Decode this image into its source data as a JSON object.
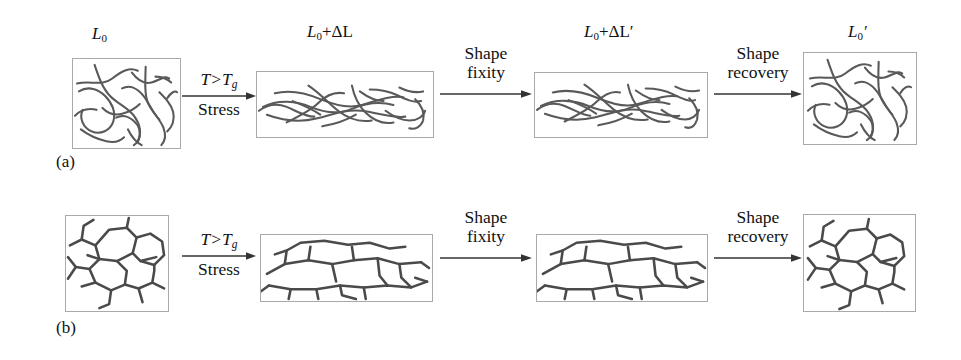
{
  "figure": {
    "background_color": "#ffffff",
    "line_color": "#4a4a4a",
    "box_border_color": "#a9a9a9",
    "width": 961,
    "height": 360
  },
  "panels": [
    {
      "id": "a",
      "label": "(a)",
      "states": [
        {
          "name": "initial",
          "length_label_parts": {
            "base": "L",
            "sub": "0",
            "suffix": ""
          }
        },
        {
          "name": "deformed",
          "length_label_parts": {
            "base": "L",
            "sub": "0",
            "suffix": "+ΔL"
          }
        },
        {
          "name": "fixed",
          "length_label_parts": {
            "base": "L",
            "sub": "0",
            "suffix": "+ΔL′"
          }
        },
        {
          "name": "recovered",
          "length_label_parts": {
            "base": "L",
            "sub": "0",
            "suffix": "′"
          }
        }
      ],
      "transitions": [
        {
          "name": "heat-and-stress",
          "line1": "T>T",
          "line1_sub": "g",
          "line2": "Stress",
          "italic": true,
          "text_position": "split"
        },
        {
          "name": "shape-fixity",
          "line1": "Shape",
          "line2": "fixity",
          "italic": false,
          "text_position": "above"
        },
        {
          "name": "shape-recovery",
          "line1": "Shape",
          "line2": "recovery",
          "italic": false,
          "text_position": "above"
        }
      ]
    },
    {
      "id": "b",
      "label": "(b)",
      "states": [
        {
          "name": "initial",
          "length_label_parts": null
        },
        {
          "name": "deformed",
          "length_label_parts": null
        },
        {
          "name": "fixed",
          "length_label_parts": null
        },
        {
          "name": "recovered",
          "length_label_parts": null
        }
      ],
      "transitions": [
        {
          "name": "heat-and-stress",
          "line1": "T>T",
          "line1_sub": "g",
          "line2": "Stress",
          "italic": true,
          "text_position": "split"
        },
        {
          "name": "shape-fixity",
          "line1": "Shape",
          "line2": "fixity",
          "italic": false,
          "text_position": "above"
        },
        {
          "name": "shape-recovery",
          "line1": "Shape",
          "line2": "recovery",
          "italic": false,
          "text_position": "above"
        }
      ]
    }
  ],
  "labels": {
    "L0": "L",
    "sub0": "0",
    "deltaL": "+ΔL",
    "deltaLprime": "+ΔL′",
    "prime": "′",
    "T_gt_Tg": "T>T",
    "g": "g",
    "stress": "Stress",
    "shape": "Shape",
    "fixity": "fixity",
    "recovery": "recovery",
    "panel_a": "(a)",
    "panel_b": "(b)"
  }
}
